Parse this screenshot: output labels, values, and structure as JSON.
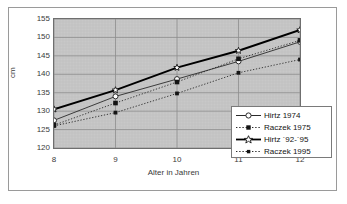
{
  "chart_data": {
    "type": "line",
    "title": "",
    "subtitle": "",
    "xlabel": "Alter in Jahren",
    "ylabel": "cm",
    "x": [
      8,
      9,
      10,
      11,
      12
    ],
    "categories": [
      "8",
      "9",
      "10",
      "11",
      "12"
    ],
    "xtick_labels": [
      "8",
      "9",
      "10",
      "11",
      "12"
    ],
    "ytick_labels": [
      "155",
      "150",
      "145",
      "140",
      "135",
      "130",
      "125",
      "120"
    ],
    "ylim": [
      120,
      155
    ],
    "ytick_step": 5,
    "xlim": [
      8,
      12
    ],
    "grid": true,
    "legend_position": "bottom-right-inside",
    "plot_background": "#c8c8c8",
    "page_background": "#ffffff",
    "series": [
      {
        "name": "Hirtz 1974",
        "values": [
          127.5,
          134.0,
          138.7,
          143.5,
          148.8
        ],
        "line_style": "solid",
        "line_width": "thin",
        "marker": "open-circle",
        "color": "#2b2b2b"
      },
      {
        "name": "Raczek 1975",
        "values": [
          126.2,
          132.2,
          137.9,
          144.2,
          149.2
        ],
        "line_style": "dotted",
        "line_width": "thin",
        "marker": "filled-square",
        "color": "#2b2b2b"
      },
      {
        "name": "Hirtz ´92-´95",
        "values": [
          130.5,
          135.7,
          141.8,
          146.4,
          152.0
        ],
        "line_style": "solid",
        "line_width": "thick",
        "marker": "open-star",
        "color": "#000000"
      },
      {
        "name": "Raczek 1995",
        "values": [
          126.0,
          129.6,
          134.8,
          140.4,
          144.0
        ],
        "line_style": "dotted",
        "line_width": "thin",
        "marker": "small-filled-square",
        "color": "#2b2b2b"
      }
    ]
  },
  "legend": {
    "entries": [
      {
        "label": "Hirtz 1974"
      },
      {
        "label": "Raczek 1975"
      },
      {
        "label": "Hirtz ´92-´95"
      },
      {
        "label": "Raczek 1995"
      }
    ]
  },
  "axes": {
    "y_axis_title": "cm",
    "x_axis_title": "Alter in Jahren"
  },
  "icons": {
    "marker_open_circle": "open-circle-marker",
    "marker_filled_square": "filled-square-marker",
    "marker_open_star": "open-star-marker",
    "marker_small_filled_square": "small-filled-square-marker"
  }
}
